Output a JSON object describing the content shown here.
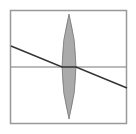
{
  "diagram": {
    "type": "optics-ray-diagram",
    "frame": {
      "x": 10.5,
      "y": 10.5,
      "width": 116,
      "height": 113,
      "stroke": "#999999"
    },
    "optical_axis": {
      "x1": 11,
      "y1": 67,
      "x2": 126,
      "y2": 67,
      "stroke": "#777777"
    },
    "lens": {
      "cx": 69,
      "top_y": 14,
      "bottom_y": 119,
      "half_width": 7,
      "fill": "#aaaaaa",
      "stroke": "#777777"
    },
    "ray": {
      "points": [
        [
          11,
          46
        ],
        [
          62,
          67
        ],
        [
          76,
          67
        ],
        [
          127,
          88
        ]
      ],
      "stroke": "#333333"
    }
  }
}
